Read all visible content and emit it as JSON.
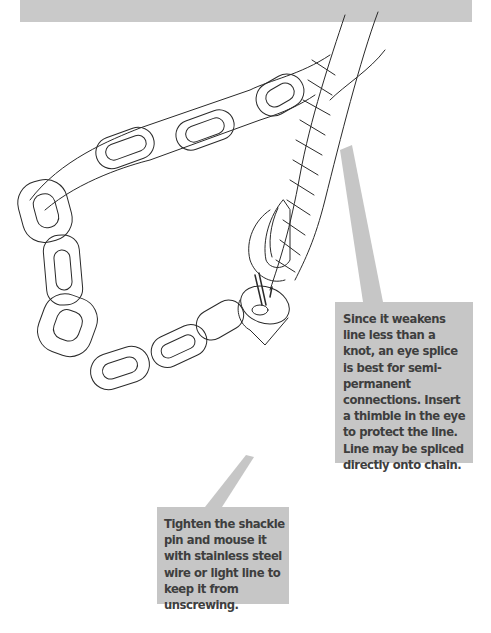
{
  "banner": {
    "color": "#c9c9c9"
  },
  "illustration": {
    "subject": "chain connected to rope with eye splice, thimble and shackle",
    "elements": [
      "chain-links",
      "three-strand-rope",
      "eye-splice",
      "thimble",
      "shackle",
      "mousing-wire"
    ]
  },
  "callouts": [
    {
      "id": "eye-splice-note",
      "text": "Since it weakens line less than a knot, an eye splice is best for semi-permanent connections. Insert a thimble in the eye to protect the line. Line may be spliced directly onto chain.",
      "lines": [
        "Since it weakens line",
        "less than a knot, an eye",
        "splice is best for semi-",
        "permanent",
        "connections. Insert a",
        "thimble in the eye to",
        "protect the line. Line",
        "may be spliced directly",
        "onto chain."
      ]
    },
    {
      "id": "shackle-pin-note",
      "text": "Tighten the shackle pin and mouse it with stainless steel wire or light line to keep it from unscrewing.",
      "lines": [
        "Tighten the shackle pin",
        "and mouse it with",
        "stainless steel wire or",
        "light line to keep it",
        "from unscrewing."
      ]
    }
  ],
  "colors": {
    "callout_bg": "#c6c6c6",
    "callout_text": "#3e3e3e",
    "line_art": "#2a2a2a"
  }
}
